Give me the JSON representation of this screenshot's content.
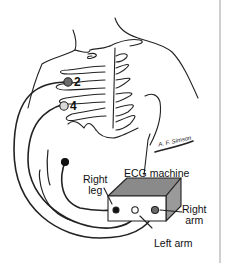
{
  "figure": {
    "electrodes": [
      {
        "id": "2",
        "label": "2",
        "color": "#6b6b6b"
      },
      {
        "id": "4",
        "label": "4",
        "color": "#d9d9d9"
      }
    ],
    "machine": {
      "label": "ECG machine",
      "top_color": "#8a8a8a",
      "side_color": "#9a9a9a",
      "front_color": "#ffffff",
      "ports": {
        "right_leg": {
          "label": "Right leg",
          "line1": "Right",
          "line2": "leg",
          "color": "#111111"
        },
        "left_arm": {
          "label": "Left arm",
          "color": "#ffffff"
        },
        "right_arm": {
          "label": "Right arm",
          "line1": "Right",
          "line2": "arm",
          "color": "#6b6b6b"
        }
      }
    },
    "signature": "A. F. Simson"
  }
}
